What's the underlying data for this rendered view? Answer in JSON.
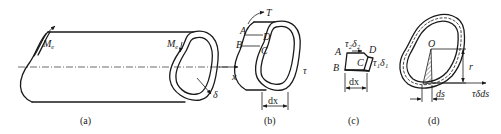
{
  "figure": {
    "panels": [
      {
        "id": "a",
        "caption": "(a)",
        "labels": {
          "moment_left": "M",
          "moment_left_sub": "e",
          "moment_right": "M",
          "moment_right_sub": "e",
          "axis": "x",
          "thickness": "δ"
        }
      },
      {
        "id": "b",
        "caption": "(b)",
        "labels": {
          "torque": "T",
          "A": "A",
          "B": "B",
          "C": "C",
          "D": "D",
          "shear": "τ",
          "length": "dx"
        }
      },
      {
        "id": "c",
        "caption": "(c)",
        "labels": {
          "A": "A",
          "B": "B",
          "C": "C",
          "D": "D",
          "top_flow": "τ₂δ₂",
          "side_flow": "τ₁δ₁",
          "length": "dx"
        }
      },
      {
        "id": "d",
        "caption": "(d)",
        "labels": {
          "origin": "O",
          "radius": "r",
          "arc": "ds",
          "force": "τδds"
        }
      }
    ]
  }
}
